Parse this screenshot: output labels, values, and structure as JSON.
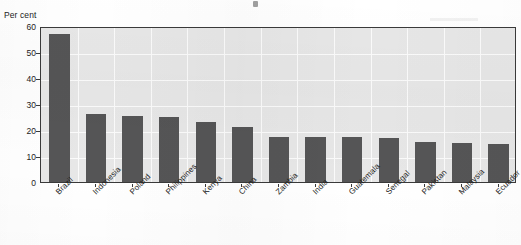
{
  "chart_data": {
    "type": "bar",
    "title": "",
    "subtitle": "",
    "xlabel": "",
    "ylabel": "Per cent",
    "ylim": [
      0,
      60
    ],
    "ytick_values": [
      0,
      10,
      20,
      30,
      40,
      50,
      60
    ],
    "ytick_labels": [
      "0",
      "10",
      "20",
      "30",
      "40",
      "50",
      "60"
    ],
    "grid": true,
    "grid_color": "#fbfbfb",
    "plot_background": "#e7e7e7",
    "bar_color": "#555556",
    "axis_color": "#3a3a3a",
    "legend": null,
    "legend_position": "none",
    "categories": [
      "Brazil",
      "Indonesia",
      "Poland",
      "Philippines",
      "Kenya",
      "China",
      "Zambia",
      "India",
      "Guatemala",
      "Senegal",
      "Pakistan",
      "Malaysia",
      "Ecuador"
    ],
    "values": [
      57,
      26,
      25.5,
      25,
      23,
      21,
      17.5,
      17.5,
      17.5,
      17,
      15.5,
      15,
      14.5
    ],
    "value_unit": "per cent",
    "annotations": []
  },
  "axis": {
    "unit_label": "Per cent"
  }
}
